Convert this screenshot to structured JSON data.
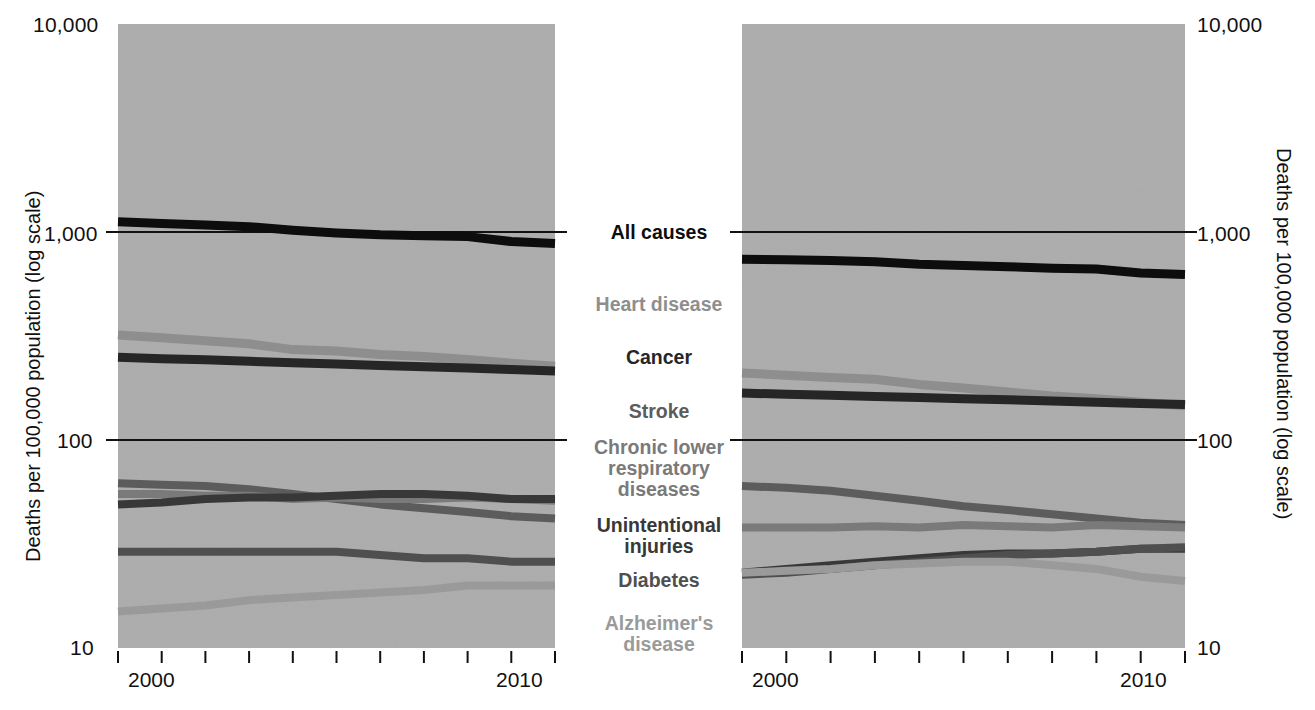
{
  "axis": {
    "y_title": "Deaths per 100,000 population (log scale)",
    "y_ticks": [
      "10,000",
      "1,000",
      "100",
      "10"
    ],
    "x_start_label": "2000",
    "x_end_label": "2010"
  },
  "panels": [
    {
      "id": "male",
      "title": "Male"
    },
    {
      "id": "female",
      "title": "Female"
    }
  ],
  "legend": [
    {
      "label": "All causes",
      "color": "#0d0d0d"
    },
    {
      "label": "Heart disease",
      "color": "#8e8e8e"
    },
    {
      "label": "Cancer",
      "color": "#262626"
    },
    {
      "label": "Stroke",
      "color": "#5c5c5c"
    },
    {
      "label": "Chronic lower\nrespiratory\ndiseases",
      "color": "#7a7a7a"
    },
    {
      "label": "Unintentional\ninjuries",
      "color": "#383838"
    },
    {
      "label": "Diabetes",
      "color": "#4f4f4f"
    },
    {
      "label": "Alzheimer's\ndisease",
      "color": "#9a9a9a"
    }
  ],
  "chart_data": {
    "type": "line",
    "xlabel": "",
    "ylabel": "Deaths per 100,000 population (log scale)",
    "y_scale": "log",
    "ylim": [
      10,
      10000
    ],
    "y_gridlines": [
      1000,
      100
    ],
    "y_ticks": [
      10,
      100,
      1000,
      10000
    ],
    "x": [
      2000,
      2001,
      2002,
      2003,
      2004,
      2005,
      2006,
      2007,
      2008,
      2009,
      2010
    ],
    "grid": true,
    "legend_position": "center",
    "panels": [
      {
        "name": "Male",
        "series": [
          {
            "name": "All causes",
            "color": "#0d0d0d",
            "width": 9,
            "values": [
              1120,
              1100,
              1080,
              1060,
              1020,
              990,
              970,
              960,
              950,
              900,
              880
            ]
          },
          {
            "name": "Heart disease",
            "color": "#8e8e8e",
            "width": 9,
            "values": [
              320,
              310,
              300,
              290,
              272,
              268,
              258,
              252,
              244,
              234,
              226
            ]
          },
          {
            "name": "Cancer",
            "color": "#262626",
            "width": 9,
            "values": [
              250,
              246,
              243,
              239,
              235,
              232,
              228,
              225,
              222,
              218,
              215
            ]
          },
          {
            "name": "Stroke",
            "color": "#5c5c5c",
            "width": 8,
            "values": [
              62,
              61,
              60,
              58,
              55,
              52,
              49,
              47,
              45,
              43,
              42
            ]
          },
          {
            "name": "Chronic lower respiratory diseases",
            "color": "#7a7a7a",
            "width": 8,
            "values": [
              55,
              55,
              54,
              54,
              52,
              53,
              52,
              52,
              53,
              52,
              51
            ]
          },
          {
            "name": "Unintentional injuries",
            "color": "#383838",
            "width": 8,
            "values": [
              49,
              50,
              52,
              53,
              53,
              54,
              55,
              55,
              54,
              52,
              52
            ]
          },
          {
            "name": "Diabetes",
            "color": "#4f4f4f",
            "width": 8,
            "values": [
              29,
              29,
              29,
              29,
              29,
              29,
              28,
              27,
              27,
              26,
              26
            ]
          },
          {
            "name": "Alzheimer's disease",
            "color": "#9a9a9a",
            "width": 8,
            "values": [
              15,
              15.5,
              16,
              17,
              17.5,
              18,
              18.5,
              19,
              20,
              20,
              20
            ]
          }
        ]
      },
      {
        "name": "Female",
        "series": [
          {
            "name": "All causes",
            "color": "#0d0d0d",
            "width": 9,
            "values": [
              740,
              735,
              730,
              720,
              700,
              690,
              680,
              670,
              665,
              635,
              625
            ]
          },
          {
            "name": "Heart disease",
            "color": "#8e8e8e",
            "width": 9,
            "values": [
              210,
              205,
              200,
              196,
              185,
              178,
              170,
              163,
              158,
              152,
              146
            ]
          },
          {
            "name": "Cancer",
            "color": "#262626",
            "width": 9,
            "values": [
              168,
              166,
              164,
              162,
              160,
              158,
              156,
              154,
              152,
              150,
              148
            ]
          },
          {
            "name": "Stroke",
            "color": "#5c5c5c",
            "width": 8,
            "values": [
              60,
              59,
              57,
              54,
              51,
              48,
              46,
              44,
              42,
              40,
              39
            ]
          },
          {
            "name": "Chronic lower respiratory diseases",
            "color": "#7a7a7a",
            "width": 8,
            "values": [
              38,
              38,
              38,
              38.5,
              38,
              39,
              38.5,
              38,
              39,
              38.5,
              38
            ]
          },
          {
            "name": "Unintentional injuries",
            "color": "#383838",
            "width": 8,
            "values": [
              23,
              24,
              25,
              26,
              27,
              28,
              28.5,
              28.5,
              29,
              30,
              30
            ]
          },
          {
            "name": "Diabetes",
            "color": "#4f4f4f",
            "width": 8,
            "values": [
              22.5,
              23,
              24,
              25,
              26,
              27,
              28,
              28.5,
              29,
              30,
              30.5
            ]
          },
          {
            "name": "Alzheimer's disease",
            "color": "#9a9a9a",
            "width": 8,
            "values": [
              23,
              23.5,
              24,
              25,
              25.5,
              26,
              26,
              25,
              24,
              22,
              21
            ]
          }
        ]
      }
    ]
  }
}
